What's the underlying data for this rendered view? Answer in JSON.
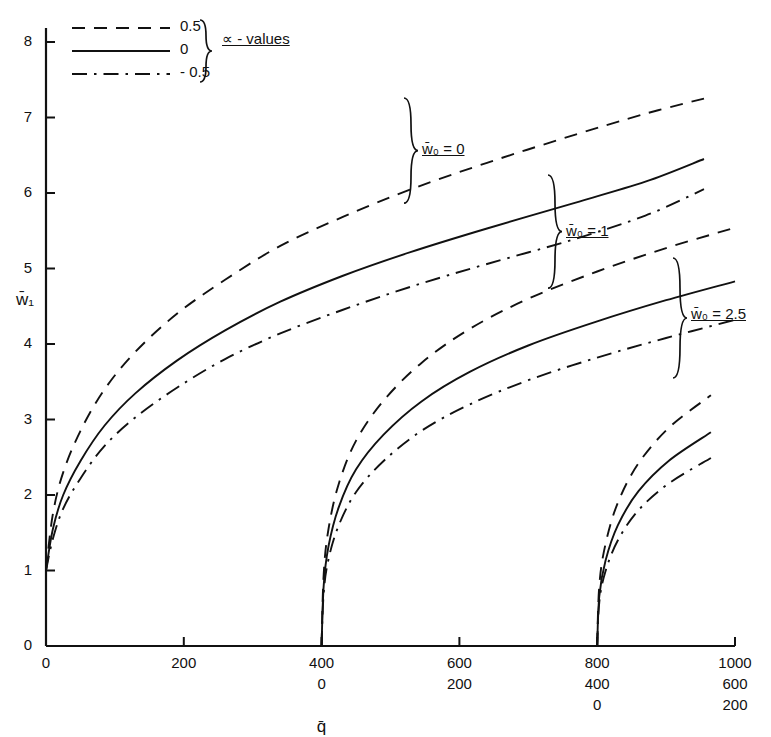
{
  "chart_data": {
    "type": "line",
    "title": "",
    "xlabel": "q̄",
    "ylabel": "w̄₁",
    "xlim": [
      0,
      1000
    ],
    "ylim": [
      0,
      8
    ],
    "grid": false,
    "x_tick_values": [
      0,
      200,
      400,
      600,
      800,
      1000
    ],
    "y_tick_values": [
      0,
      1,
      2,
      3,
      4,
      5,
      6,
      7,
      8
    ],
    "y_tick_labels": [
      "0",
      "1",
      "2",
      "3",
      "4",
      "5",
      "6",
      "7",
      "8"
    ],
    "x_axis_rows": [
      {
        "offset": 0,
        "labels": [
          "0",
          "200",
          "400",
          "600",
          "800",
          "1000"
        ]
      },
      {
        "offset": 400,
        "labels": [
          "0",
          "200",
          "400",
          "600",
          "800",
          "1000"
        ]
      },
      {
        "offset": 800,
        "labels": [
          "0",
          "200",
          "400",
          "600",
          "800",
          "1000"
        ]
      }
    ],
    "legend": {
      "title": "∝ - values",
      "position": "top-left",
      "entries": [
        {
          "label": "0.5",
          "style": "dashed"
        },
        {
          "label": "0",
          "style": "solid"
        },
        {
          "label": "- 0.5",
          "style": "dash-dot"
        }
      ]
    },
    "annotations": [
      {
        "text": "w̄₀ = 0",
        "group": 1
      },
      {
        "text": "w̄₀ = 1",
        "group": 2
      },
      {
        "text": "w̄₀ = 2.5",
        "group": 3
      }
    ],
    "series": [
      {
        "name": "w0=0, alpha=0.5",
        "group": 1,
        "style": "dashed",
        "x": [
          0,
          10,
          25,
          50,
          85,
          130,
          190,
          260,
          340,
          430,
          530,
          640,
          760,
          870,
          955
        ],
        "y": [
          1.0,
          1.75,
          2.3,
          2.85,
          3.4,
          3.9,
          4.4,
          4.85,
          5.3,
          5.68,
          6.05,
          6.4,
          6.75,
          7.05,
          7.25
        ]
      },
      {
        "name": "w0=0, alpha=0",
        "group": 1,
        "style": "solid",
        "x": [
          0,
          10,
          25,
          50,
          85,
          130,
          190,
          260,
          340,
          430,
          530,
          640,
          760,
          870,
          955
        ],
        "y": [
          1.0,
          1.55,
          2.0,
          2.45,
          2.92,
          3.35,
          3.78,
          4.18,
          4.56,
          4.9,
          5.22,
          5.53,
          5.85,
          6.15,
          6.45
        ]
      },
      {
        "name": "w0=0, alpha=-0.5",
        "group": 1,
        "style": "dash-dot",
        "x": [
          0,
          10,
          25,
          50,
          85,
          130,
          190,
          260,
          340,
          430,
          530,
          640,
          760,
          870,
          955
        ],
        "y": [
          1.0,
          1.42,
          1.82,
          2.22,
          2.65,
          3.03,
          3.42,
          3.8,
          4.14,
          4.45,
          4.76,
          5.06,
          5.37,
          5.7,
          6.05
        ]
      },
      {
        "name": "w0=1, alpha=0.5",
        "group": 2,
        "style": "dashed",
        "x": [
          400,
          403,
          410,
          425,
          450,
          490,
          545,
          615,
          700,
          800,
          900,
          1000,
          1100,
          1230,
          1355
        ],
        "y": [
          0.0,
          0.95,
          1.55,
          2.15,
          2.72,
          3.25,
          3.75,
          4.2,
          4.6,
          4.96,
          5.27,
          5.54,
          5.78,
          6.05,
          6.28
        ]
      },
      {
        "name": "w0=1, alpha=0",
        "group": 2,
        "style": "solid",
        "x": [
          400,
          403,
          410,
          425,
          450,
          490,
          545,
          615,
          700,
          800,
          900,
          1000,
          1100,
          1230,
          1355
        ],
        "y": [
          0.0,
          0.8,
          1.32,
          1.84,
          2.34,
          2.8,
          3.24,
          3.63,
          3.98,
          4.3,
          4.58,
          4.83,
          5.05,
          5.31,
          5.53
        ]
      },
      {
        "name": "w0=1, alpha=-0.5",
        "group": 2,
        "style": "dash-dot",
        "x": [
          400,
          403,
          410,
          425,
          450,
          490,
          545,
          615,
          700,
          800,
          900,
          1000,
          1100,
          1230,
          1355
        ],
        "y": [
          0.0,
          0.7,
          1.15,
          1.6,
          2.04,
          2.45,
          2.85,
          3.2,
          3.52,
          3.82,
          4.08,
          4.32,
          4.54,
          4.8,
          5.02
        ]
      },
      {
        "name": "w0=2.5, alpha=0.5",
        "group": 3,
        "style": "dashed",
        "x": [
          800,
          803,
          812,
          830,
          860,
          905,
          965,
          1040,
          1130,
          1235,
          1345,
          1460,
          1580,
          1700,
          1800
        ],
        "y": [
          0.0,
          0.8,
          1.35,
          1.9,
          2.42,
          2.9,
          3.32,
          3.7,
          4.03,
          4.33,
          4.58,
          4.78,
          4.93,
          5.02,
          5.07
        ]
      },
      {
        "name": "w0=2.5, alpha=0",
        "group": 3,
        "style": "solid",
        "x": [
          800,
          803,
          812,
          830,
          860,
          905,
          965,
          1040,
          1130,
          1235,
          1345,
          1460,
          1580,
          1700,
          1800
        ],
        "y": [
          0.0,
          0.66,
          1.13,
          1.6,
          2.05,
          2.46,
          2.83,
          3.16,
          3.45,
          3.71,
          3.93,
          4.1,
          4.22,
          4.27,
          4.28
        ]
      },
      {
        "name": "w0=2.5, alpha=-0.5",
        "group": 3,
        "style": "dash-dot",
        "x": [
          800,
          803,
          812,
          830,
          860,
          905,
          965,
          1040,
          1130,
          1235,
          1345,
          1460,
          1580,
          1700,
          1800
        ],
        "y": [
          0.0,
          0.58,
          0.99,
          1.4,
          1.8,
          2.16,
          2.49,
          2.79,
          3.05,
          3.28,
          3.48,
          3.64,
          3.75,
          3.81,
          3.84
        ]
      }
    ]
  },
  "colors": {
    "ink": "#111111",
    "background": "#ffffff"
  }
}
